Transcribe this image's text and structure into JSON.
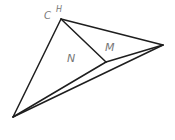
{
  "diagram": {
    "type": "geometric-figure",
    "stroke_color": "#1e1e1e",
    "label_color": "#777777",
    "vertices": {
      "C": {
        "x": 61,
        "y": 19
      },
      "R": {
        "x": 163,
        "y": 45
      },
      "B": {
        "x": 13,
        "y": 117
      },
      "J": {
        "x": 106,
        "y": 62
      }
    },
    "labels": {
      "c": "C",
      "h": "H",
      "n": "N",
      "m": "M"
    },
    "edges": [
      {
        "from": "C",
        "to": "R"
      },
      {
        "from": "C",
        "to": "B"
      },
      {
        "from": "C",
        "to": "J"
      },
      {
        "from": "J",
        "to": "R"
      },
      {
        "from": "B",
        "to": "J"
      },
      {
        "from": "B",
        "to": "R"
      }
    ]
  }
}
